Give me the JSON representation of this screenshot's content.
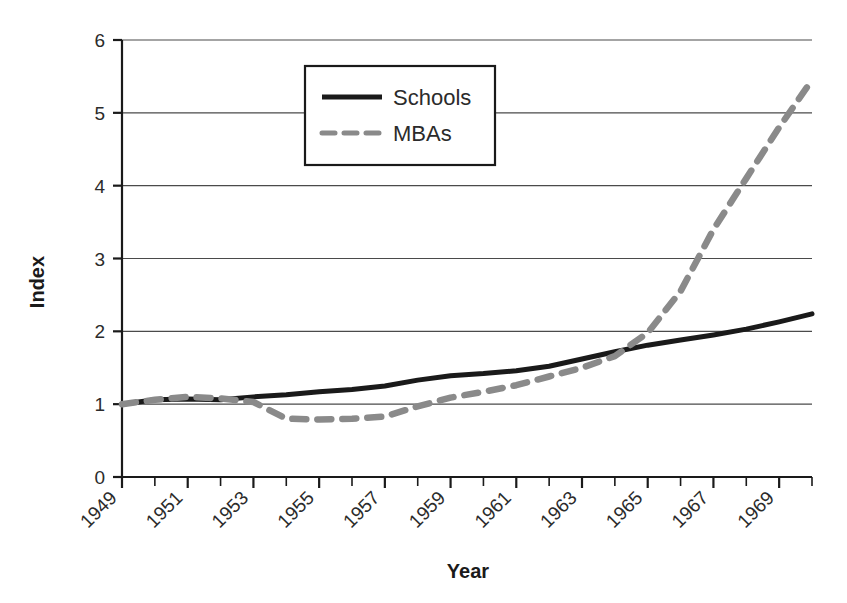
{
  "chart_data": {
    "type": "line",
    "title": "",
    "xlabel": "Year",
    "ylabel": "Index",
    "xlim": [
      1949,
      1970
    ],
    "ylim": [
      0,
      6
    ],
    "yticks": [
      0,
      1,
      2,
      3,
      4,
      5,
      6
    ],
    "ytick_labels": [
      "0",
      "1",
      "2",
      "3",
      "4",
      "5",
      "6"
    ],
    "xticks": [
      1949,
      1950,
      1951,
      1952,
      1953,
      1954,
      1955,
      1956,
      1957,
      1958,
      1959,
      1960,
      1961,
      1962,
      1963,
      1964,
      1965,
      1966,
      1967,
      1968,
      1969,
      1970
    ],
    "xtick_labels": [
      "1949",
      "",
      "1951",
      "",
      "1953",
      "",
      "1955",
      "",
      "1957",
      "",
      "1959",
      "",
      "1961",
      "",
      "1963",
      "",
      "1965",
      "",
      "1967",
      "",
      "1969",
      ""
    ],
    "x_labeled_years": [
      "1949",
      "1951",
      "1953",
      "1955",
      "1957",
      "1959",
      "1961",
      "1963",
      "1965",
      "1967",
      "1969"
    ],
    "grid": "horizontal",
    "legend_position": "upper-center-left",
    "x": [
      1949,
      1950,
      1951,
      1952,
      1953,
      1954,
      1955,
      1956,
      1957,
      1958,
      1959,
      1960,
      1961,
      1962,
      1963,
      1964,
      1965,
      1966,
      1967,
      1968,
      1969,
      1970
    ],
    "series": [
      {
        "name": "Schools",
        "style": "solid",
        "color": "#1a1a1a",
        "values": [
          1.0,
          1.06,
          1.07,
          1.06,
          1.1,
          1.13,
          1.17,
          1.2,
          1.25,
          1.33,
          1.39,
          1.42,
          1.46,
          1.52,
          1.62,
          1.72,
          1.81,
          1.88,
          1.95,
          2.03,
          2.13,
          2.24
        ]
      },
      {
        "name": "MBAs",
        "style": "dashed",
        "color": "#8a8a8a",
        "values": [
          1.0,
          1.06,
          1.1,
          1.08,
          1.03,
          0.8,
          0.79,
          0.8,
          0.83,
          0.97,
          1.09,
          1.17,
          1.26,
          1.38,
          1.5,
          1.66,
          1.98,
          2.55,
          3.4,
          4.1,
          4.8,
          5.45
        ]
      }
    ]
  },
  "legend": {
    "items": [
      {
        "label": "Schools",
        "style": "solid",
        "color": "#1a1a1a"
      },
      {
        "label": "MBAs",
        "style": "dashed",
        "color": "#8a8a8a"
      }
    ]
  },
  "axes": {
    "y_title": "Index",
    "x_title": "Year"
  }
}
